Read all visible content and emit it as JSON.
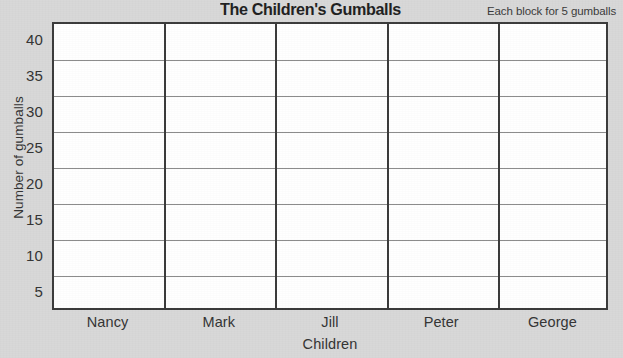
{
  "chart_data": {
    "type": "bar",
    "title": "The Children's Gumballs",
    "subtitle": "Each block for 5 gumballs",
    "xlabel": "Children",
    "ylabel": "Number of gumballs",
    "categories": [
      "Nancy",
      "Mark",
      "Jill",
      "Peter",
      "George"
    ],
    "values": [
      0,
      0,
      0,
      0,
      0
    ],
    "ytick_labels": [
      "40",
      "35",
      "30",
      "25",
      "20",
      "15",
      "10",
      "5"
    ],
    "ytick_values": [
      40,
      35,
      30,
      25,
      20,
      15,
      10,
      5
    ],
    "ylim": [
      0,
      40
    ],
    "y_step": 5,
    "grid": true,
    "legend": "none",
    "block_value": 5,
    "row_count": 8,
    "column_count": 5,
    "plot_filled": false,
    "colors": {
      "background": "#d8d8d8",
      "plot_background": "#ffffff",
      "frame": "#3a3a3a",
      "gridline": "#8b8b8b",
      "column_divider": "#3a3a3a",
      "title_text": "#1f1f1f",
      "label_text": "#333333"
    }
  }
}
